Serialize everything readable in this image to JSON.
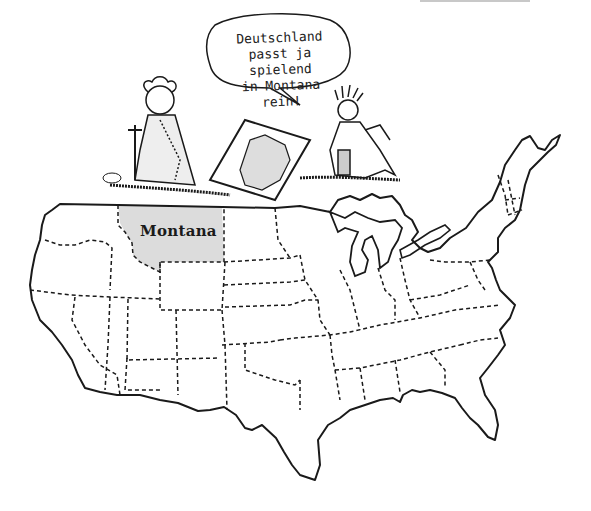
{
  "illustration": {
    "type": "hand-drawn cartoon map",
    "subject": "Contiguous United States with Montana highlighted",
    "background_color": "#ffffff",
    "ink_color": "#1a1a1a",
    "highlight_color": "#dcdcdc"
  },
  "speech_bubble": {
    "lines": [
      "Deutschland",
      "passt ja spielend",
      "in Montana rein!"
    ],
    "speaker": "statue-of-liberty"
  },
  "map": {
    "highlighted_state": {
      "label": "Montana",
      "fill": "#dcdcdc"
    },
    "borders": {
      "national": "solid",
      "state": "dashed"
    }
  },
  "characters": [
    {
      "name": "Germania",
      "position": "left",
      "holding": "sword"
    },
    {
      "name": "Statue of Liberty",
      "position": "right",
      "holding": "map of Germany"
    }
  ],
  "held_map": {
    "depicts": "Germany outline"
  },
  "signature": {
    "present": true
  }
}
